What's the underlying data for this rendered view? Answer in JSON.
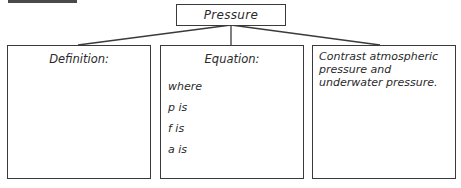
{
  "diagram": {
    "title": "Pressure",
    "panels": [
      {
        "heading": "Definition:"
      },
      {
        "heading": "Equation:",
        "lines": [
          "where",
          "p is",
          "f is",
          "a is"
        ]
      },
      {
        "prompt": "Contrast atmospheric pressure and underwater pressure."
      }
    ]
  }
}
